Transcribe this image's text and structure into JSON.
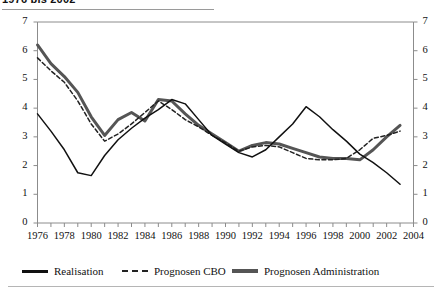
{
  "title": {
    "text": "1976 bis 2002",
    "cropped": true
  },
  "legend": {
    "position": "bottom",
    "items": [
      {
        "label": "Realisation",
        "style": "solid-thin",
        "color": "#111111"
      },
      {
        "label": "Prognosen CBO",
        "style": "dashed-thin",
        "color": "#222222"
      },
      {
        "label": "Prognosen Administration",
        "style": "solid-thick",
        "color": "#555555"
      }
    ]
  },
  "axes": {
    "y_left_ticks": [
      "0",
      "1",
      "2",
      "3",
      "4",
      "5",
      "6",
      "7"
    ],
    "y_right_ticks": [
      "0",
      "1",
      "2",
      "3",
      "4",
      "5",
      "6",
      "7"
    ],
    "x_labels": [
      "1976",
      "1978",
      "1980",
      "1982",
      "1984",
      "1986",
      "1988",
      "1990",
      "1992",
      "1994",
      "1996",
      "1998",
      "2000",
      "2002",
      "2004"
    ]
  },
  "chart_data": {
    "type": "line",
    "title": "1976 bis 2002",
    "xlabel": "",
    "ylabel": "",
    "xlim": [
      1976,
      2004
    ],
    "ylim": [
      0,
      7
    ],
    "grid": false,
    "legend_position": "bottom",
    "x": [
      1976,
      1977,
      1978,
      1979,
      1980,
      1981,
      1982,
      1983,
      1984,
      1985,
      1986,
      1987,
      1988,
      1989,
      1990,
      1991,
      1992,
      1993,
      1994,
      1995,
      1996,
      1997,
      1998,
      1999,
      2000,
      2001,
      2002,
      2003
    ],
    "series": [
      {
        "name": "Realisation",
        "style": "solid-thin",
        "color": "#111111",
        "values": [
          3.8,
          3.2,
          2.55,
          1.75,
          1.65,
          2.35,
          2.9,
          3.3,
          3.65,
          3.95,
          4.3,
          4.15,
          3.6,
          3.05,
          2.75,
          2.45,
          2.3,
          2.55,
          3.0,
          3.45,
          4.05,
          3.7,
          3.25,
          2.85,
          2.4,
          2.1,
          1.75,
          1.35
        ]
      },
      {
        "name": "Prognosen CBO",
        "style": "dashed-thin",
        "color": "#222222",
        "values": [
          5.75,
          5.3,
          4.9,
          4.25,
          3.45,
          2.85,
          3.1,
          3.45,
          3.85,
          4.25,
          3.95,
          3.6,
          3.35,
          3.05,
          2.8,
          2.5,
          2.65,
          2.7,
          2.65,
          2.45,
          2.25,
          2.2,
          2.2,
          2.25,
          2.55,
          2.95,
          3.05,
          3.2
        ]
      },
      {
        "name": "Prognosen Administration",
        "style": "solid-thick",
        "color": "#555555",
        "values": [
          6.2,
          5.55,
          5.1,
          4.55,
          3.7,
          3.05,
          3.6,
          3.85,
          3.55,
          4.3,
          4.25,
          3.8,
          3.4,
          3.1,
          2.8,
          2.5,
          2.7,
          2.8,
          2.75,
          2.6,
          2.45,
          2.3,
          2.25,
          2.25,
          2.2,
          2.55,
          3.0,
          3.4
        ]
      }
    ]
  }
}
